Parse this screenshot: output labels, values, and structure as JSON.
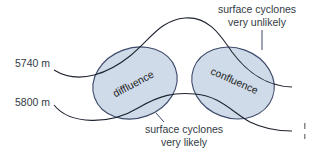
{
  "diagram": {
    "contours": [
      {
        "label": "5740 m"
      },
      {
        "label": "5800 m"
      }
    ],
    "regions": [
      {
        "label": "diffluence"
      },
      {
        "label": "confluence"
      }
    ],
    "annotations": {
      "unlikely": {
        "line1": "surface cyclones",
        "line2": "very unlikely"
      },
      "likely": {
        "line1": "surface cyclones",
        "line2": "very likely"
      }
    },
    "colors": {
      "region_fill": "#cfdbe9",
      "region_stroke": "#3e4a6a",
      "contour_stroke": "#1e2430",
      "text": "#333a45"
    }
  }
}
